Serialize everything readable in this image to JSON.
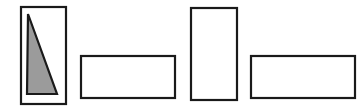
{
  "figure": {
    "caption": "",
    "background_color": "#ffffff",
    "width": 358,
    "height": 109,
    "stroke_color": "#1a1a1a",
    "stroke_width": 2.2,
    "fill_none": "#ffffff",
    "fill_gray": "#9b9b9b",
    "shapes": [
      {
        "id": "shape-1",
        "name": "tall-rectangle-with-shaded-triangle",
        "type": "rectangle",
        "x": 21,
        "y": 7,
        "width": 45,
        "height": 97,
        "fill": "#ffffff",
        "label": "Shape 1"
      },
      {
        "id": "shape-1-triangle",
        "name": "shaded-right-triangle",
        "type": "triangle",
        "points": "28,14 57,94 27,94",
        "fill": "#9b9b9b",
        "label": "Shaded triangle"
      },
      {
        "id": "shape-2",
        "name": "wide-rectangle-left",
        "type": "rectangle",
        "x": 81,
        "y": 56,
        "width": 94,
        "height": 42,
        "fill": "#ffffff",
        "label": "Shape 2"
      },
      {
        "id": "shape-3",
        "name": "tall-rectangle-right",
        "type": "rectangle",
        "x": 191,
        "y": 8,
        "width": 46,
        "height": 92,
        "fill": "#ffffff",
        "label": "Shape 3"
      },
      {
        "id": "shape-4",
        "name": "wide-rectangle-right",
        "type": "rectangle",
        "x": 251,
        "y": 56,
        "width": 104,
        "height": 42,
        "fill": "#ffffff",
        "label": "Shape 4"
      }
    ]
  }
}
